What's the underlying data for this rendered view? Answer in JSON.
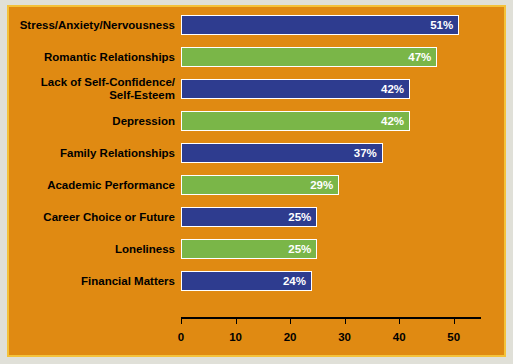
{
  "chart_data": {
    "type": "bar",
    "orientation": "horizontal",
    "title": "",
    "xlabel": "",
    "ylabel": "",
    "xlim": [
      0,
      55
    ],
    "xticks": [
      0,
      10,
      20,
      30,
      40,
      50
    ],
    "grid": false,
    "legend": "none",
    "value_suffix": "%",
    "colors": {
      "background": "#e08a12",
      "border": "#f4c23a",
      "bar_blue": "#2e3c8f",
      "bar_green": "#7ab648",
      "bar_outline": "#ffffff",
      "value_text": "#ffffff",
      "label_text": "#000000"
    },
    "categories": [
      "Stress/Anxiety/Nervousness",
      "Romantic Relationships",
      "Lack of Self-Confidence/ Self-Esteem",
      "Depression",
      "Family Relationships",
      "Academic Performance",
      "Career Choice or Future",
      "Loneliness",
      "Financial Matters"
    ],
    "bars": [
      {
        "label_line1": "Stress/Anxiety/Nervousness",
        "label_line2": "",
        "value": 51,
        "value_label": "51%",
        "color": "blue"
      },
      {
        "label_line1": "Romantic Relationships",
        "label_line2": "",
        "value": 47,
        "value_label": "47%",
        "color": "green"
      },
      {
        "label_line1": "Lack of Self-Confidence/",
        "label_line2": "Self-Esteem",
        "value": 42,
        "value_label": "42%",
        "color": "blue"
      },
      {
        "label_line1": "Depression",
        "label_line2": "",
        "value": 42,
        "value_label": "42%",
        "color": "green"
      },
      {
        "label_line1": "Family Relationships",
        "label_line2": "",
        "value": 37,
        "value_label": "37%",
        "color": "blue"
      },
      {
        "label_line1": "Academic Performance",
        "label_line2": "",
        "value": 29,
        "value_label": "29%",
        "color": "green"
      },
      {
        "label_line1": "Career Choice or Future",
        "label_line2": "",
        "value": 25,
        "value_label": "25%",
        "color": "blue"
      },
      {
        "label_line1": "Loneliness",
        "label_line2": "",
        "value": 25,
        "value_label": "25%",
        "color": "green"
      },
      {
        "label_line1": "Financial Matters",
        "label_line2": "",
        "value": 24,
        "value_label": "24%",
        "color": "blue"
      }
    ],
    "values": [
      51,
      47,
      42,
      42,
      37,
      29,
      25,
      25,
      24
    ]
  }
}
